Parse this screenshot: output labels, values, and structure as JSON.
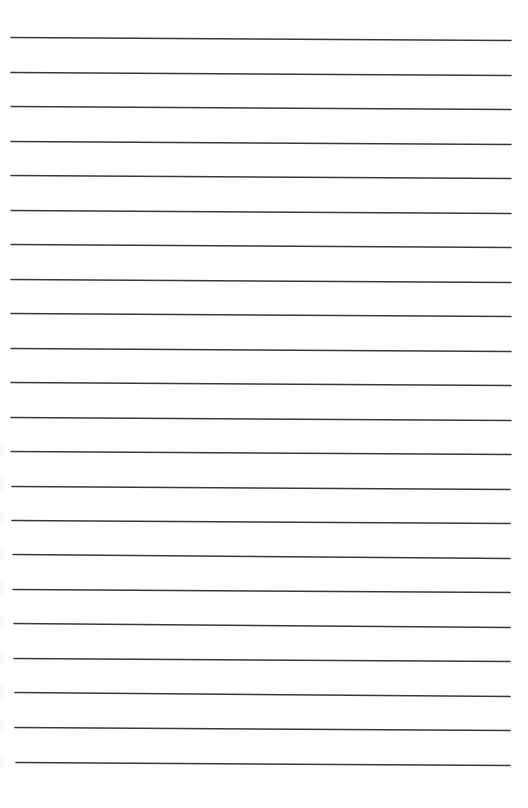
{
  "page": {
    "type": "lined-paper",
    "background_color": "#ffffff",
    "line_color": "#3a3a3a",
    "line_count": 22,
    "line_thickness": 1.6
  },
  "lines": [
    {
      "x1": 11,
      "y1": 37,
      "x2": 511,
      "y2": 40
    },
    {
      "x1": 11,
      "y1": 72,
      "x2": 511,
      "y2": 75
    },
    {
      "x1": 11,
      "y1": 106,
      "x2": 511,
      "y2": 109
    },
    {
      "x1": 11,
      "y1": 141,
      "x2": 511,
      "y2": 144
    },
    {
      "x1": 11,
      "y1": 175,
      "x2": 511,
      "y2": 178
    },
    {
      "x1": 11,
      "y1": 210,
      "x2": 511,
      "y2": 213
    },
    {
      "x1": 11,
      "y1": 244,
      "x2": 511,
      "y2": 247
    },
    {
      "x1": 11,
      "y1": 279,
      "x2": 511,
      "y2": 282
    },
    {
      "x1": 11,
      "y1": 313,
      "x2": 511,
      "y2": 316
    },
    {
      "x1": 11,
      "y1": 348,
      "x2": 511,
      "y2": 351
    },
    {
      "x1": 11,
      "y1": 382,
      "x2": 511,
      "y2": 385
    },
    {
      "x1": 11,
      "y1": 417,
      "x2": 511,
      "y2": 420
    },
    {
      "x1": 11,
      "y1": 451,
      "x2": 511,
      "y2": 454
    },
    {
      "x1": 12,
      "y1": 486,
      "x2": 510,
      "y2": 489
    },
    {
      "x1": 12,
      "y1": 520,
      "x2": 510,
      "y2": 523
    },
    {
      "x1": 13,
      "y1": 554,
      "x2": 510,
      "y2": 558
    },
    {
      "x1": 13,
      "y1": 589,
      "x2": 510,
      "y2": 592
    },
    {
      "x1": 14,
      "y1": 623,
      "x2": 510,
      "y2": 627
    },
    {
      "x1": 14,
      "y1": 658,
      "x2": 510,
      "y2": 661
    },
    {
      "x1": 15,
      "y1": 692,
      "x2": 510,
      "y2": 696
    },
    {
      "x1": 15,
      "y1": 727,
      "x2": 510,
      "y2": 730
    },
    {
      "x1": 16,
      "y1": 762,
      "x2": 510,
      "y2": 765
    }
  ],
  "edge_shadows": [
    {
      "cy": 450
    },
    {
      "cy": 485
    },
    {
      "cy": 519
    },
    {
      "cy": 553
    },
    {
      "cy": 588
    },
    {
      "cy": 622
    },
    {
      "cy": 657
    },
    {
      "cy": 691
    },
    {
      "cy": 726
    },
    {
      "cy": 761
    }
  ]
}
